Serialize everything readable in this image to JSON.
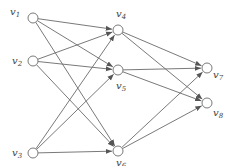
{
  "diagram": {
    "type": "directed-graph",
    "layers": [
      [
        "v1",
        "v2",
        "v3"
      ],
      [
        "v4",
        "v5",
        "v6"
      ],
      [
        "v7",
        "v8"
      ]
    ],
    "nodes": [
      {
        "id": "v1",
        "label": "v1",
        "x": 33,
        "y": 18,
        "lx": 10,
        "ly": 15
      },
      {
        "id": "v2",
        "label": "v2",
        "x": 33,
        "y": 61,
        "lx": 12,
        "ly": 64
      },
      {
        "id": "v3",
        "label": "v3",
        "x": 33,
        "y": 153,
        "lx": 12,
        "ly": 156
      },
      {
        "id": "v4",
        "label": "v4",
        "x": 118,
        "y": 30,
        "lx": 116,
        "ly": 17
      },
      {
        "id": "v5",
        "label": "v5",
        "x": 118,
        "y": 70,
        "lx": 116,
        "ly": 89
      },
      {
        "id": "v6",
        "label": "v6",
        "x": 118,
        "y": 151,
        "lx": 116,
        "ly": 166
      },
      {
        "id": "v7",
        "label": "v7",
        "x": 207,
        "y": 68,
        "lx": 213,
        "ly": 78
      },
      {
        "id": "v8",
        "label": "v8",
        "x": 207,
        "y": 103,
        "lx": 213,
        "ly": 116
      }
    ],
    "edges": [
      {
        "from": "v1",
        "to": "v4"
      },
      {
        "from": "v1",
        "to": "v5"
      },
      {
        "from": "v1",
        "to": "v6"
      },
      {
        "from": "v2",
        "to": "v4"
      },
      {
        "from": "v2",
        "to": "v5"
      },
      {
        "from": "v2",
        "to": "v6"
      },
      {
        "from": "v3",
        "to": "v4"
      },
      {
        "from": "v3",
        "to": "v5"
      },
      {
        "from": "v3",
        "to": "v6"
      },
      {
        "from": "v4",
        "to": "v7"
      },
      {
        "from": "v4",
        "to": "v8"
      },
      {
        "from": "v5",
        "to": "v7"
      },
      {
        "from": "v5",
        "to": "v8"
      },
      {
        "from": "v6",
        "to": "v7"
      },
      {
        "from": "v6",
        "to": "v8"
      }
    ],
    "node_radius": 5,
    "colors": {
      "edge": "#6a6a6a",
      "node_stroke": "#7a7a7a",
      "label": "#444444"
    }
  }
}
